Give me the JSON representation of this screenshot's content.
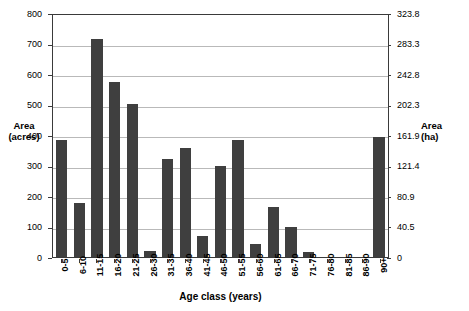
{
  "chart_data": {
    "type": "bar",
    "title": "",
    "xlabel": "Age class (years)",
    "ylabel": "Area (acres)",
    "ylabel_secondary": "Area (ha)",
    "grid": true,
    "legend": "none",
    "ylim": [
      0,
      800
    ],
    "ylim_secondary": [
      0,
      323.8
    ],
    "yticks": [
      0,
      100,
      200,
      300,
      400,
      500,
      600,
      700,
      800
    ],
    "yticklabels": [
      "0",
      "100",
      "200",
      "300",
      "400",
      "500",
      "600",
      "700",
      "800"
    ],
    "yticks_secondary": [
      0,
      40.5,
      80.9,
      121.4,
      161.9,
      202.3,
      242.8,
      283.3,
      323.8
    ],
    "yticklabels_secondary": [
      "0",
      "40.5",
      "80.9",
      "121.4",
      "161.9",
      "202.3",
      "242.8",
      "283.3",
      "323.8"
    ],
    "categories": [
      "0-5",
      "6-10",
      "11-15",
      "16-20",
      "21-25",
      "26-30",
      "31-35",
      "36-40",
      "41-45",
      "46-50",
      "51-55",
      "56-60",
      "61-65",
      "66-70",
      "71-75",
      "76-80",
      "81-85",
      "86-90",
      "90+"
    ],
    "values": [
      383,
      177,
      715,
      573,
      503,
      20,
      321,
      358,
      70,
      297,
      385,
      44,
      165,
      97,
      18,
      0,
      0,
      0,
      395
    ],
    "bar_color": "#3f3f3f",
    "axis_color": "#3a3a3a",
    "gridline_color": "#b9b9b9",
    "background_color": "#ffffff"
  }
}
